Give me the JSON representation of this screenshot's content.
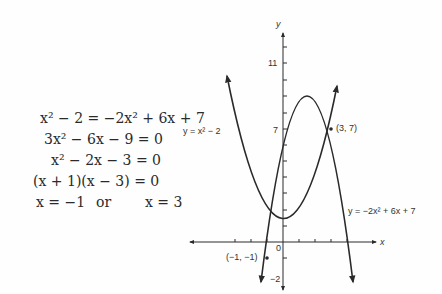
{
  "derivation": {
    "lines": [
      "x² − 2 = −2x² + 6x + 7",
      "3x² − 6x − 9 = 0",
      "x² − 2x − 3 = 0",
      "(x + 1)(x − 3) = 0"
    ],
    "solution_left": "x = −1",
    "solution_or": "or",
    "solution_right": "x = 3"
  },
  "graph": {
    "x_axis_label": "x",
    "y_axis_label": "y",
    "origin_label": "0",
    "y_tick_labels": {
      "eleven": "11",
      "seven": "7",
      "minus_two": "−2"
    },
    "curve1_label": "y = x² − 2",
    "curve2_label": "y = −2x² + 6x + 7",
    "point1_label": "(−1, −1)",
    "point2_label": "(3, 7)",
    "colors": {
      "ink": "#2a2a2a",
      "background": "#fefefe"
    }
  }
}
